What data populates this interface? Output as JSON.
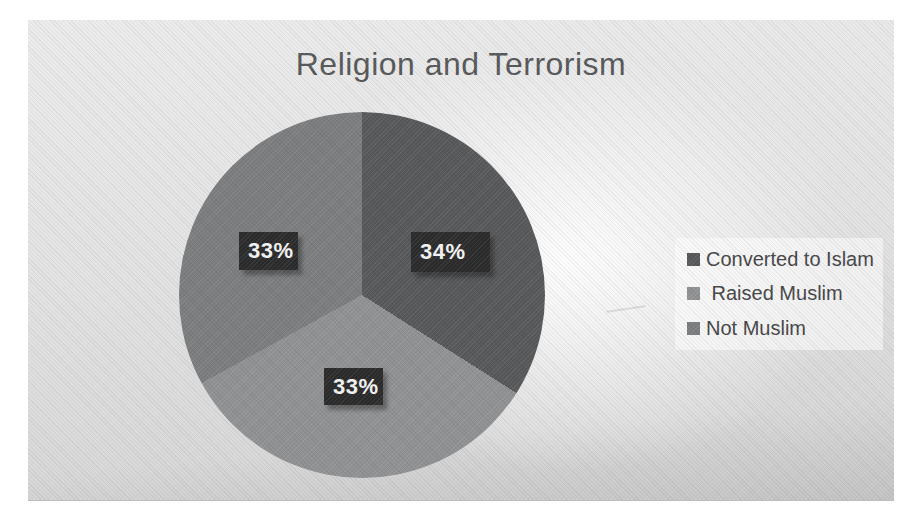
{
  "title": {
    "text": "Religion and Terrorism",
    "color": "#565758"
  },
  "chart_data": {
    "type": "pie",
    "title": "Religion and Terrorism",
    "categories": [
      "Converted to Islam",
      "Raised Muslim",
      "Not Muslim"
    ],
    "values": [
      34,
      33,
      33
    ],
    "slices": [
      {
        "label": "Converted to Islam",
        "value": 34,
        "display_label": "34%",
        "color": "#57585a"
      },
      {
        "label": "Raised Muslim",
        "value": 33,
        "display_label": "33%",
        "color": "#8f9193"
      },
      {
        "label": "Not Muslim",
        "value": 33,
        "display_label": "33%",
        "color": "#7b7d7f"
      }
    ],
    "start_angle_deg": 0,
    "direction": "clockwise",
    "legend_position": "right",
    "data_labels": "percent-on-slice",
    "label_box_color": "#2b2b2b",
    "label_text_color": "#f4f4f4"
  },
  "legend": {
    "items": [
      {
        "label": "Converted to Islam",
        "swatch_color": "#57585a"
      },
      {
        "label": " Raised Muslim",
        "swatch_color": "#8f9193"
      },
      {
        "label": "Not Muslim",
        "swatch_color": "#7b7d7f"
      }
    ]
  }
}
